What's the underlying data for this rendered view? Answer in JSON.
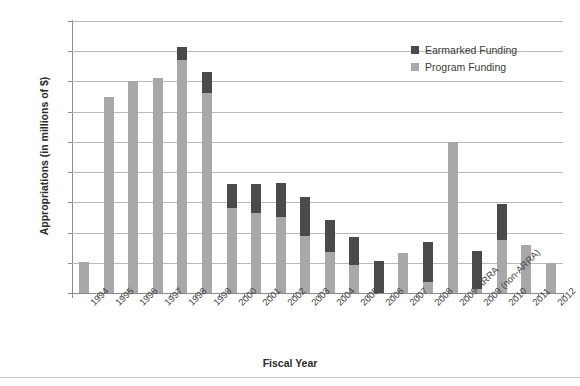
{
  "chart_data": {
    "type": "bar",
    "title": "",
    "xlabel": "Fiscal Year",
    "ylabel": "Appropriations (in millions of $)",
    "ylim": [
      0,
      1800
    ],
    "ytick_step": 200,
    "yticks": [
      0,
      200,
      400,
      600,
      800,
      1000,
      1200,
      1400,
      1600,
      1800
    ],
    "grid": true,
    "stacked": true,
    "legend_position": "upper right",
    "categories": [
      "1994",
      "1995",
      "1996",
      "1997",
      "1998",
      "1999",
      "2000",
      "2001",
      "2002",
      "2003",
      "2004",
      "2005",
      "2006",
      "2007",
      "2008",
      "2009-ARRA",
      "2009 (non-ARRA)",
      "2010",
      "2011",
      "2012"
    ],
    "series": [
      {
        "name": "Program Funding",
        "color": "#a8a8a8",
        "values": [
          205,
          1300,
          1400,
          1420,
          1540,
          1325,
          560,
          530,
          500,
          375,
          270,
          185,
          0,
          265,
          75,
          1000,
          25,
          350,
          315,
          200
        ]
      },
      {
        "name": "Earmarked Funding",
        "color": "#4a4a4a",
        "values": [
          0,
          0,
          0,
          0,
          90,
          135,
          160,
          190,
          230,
          260,
          210,
          185,
          215,
          0,
          265,
          0,
          255,
          240,
          0,
          0
        ]
      }
    ],
    "totals": [
      205,
      1300,
      1400,
      1420,
      1630,
      1460,
      720,
      720,
      730,
      635,
      480,
      370,
      215,
      265,
      340,
      1000,
      280,
      590,
      315,
      200
    ]
  },
  "legend": {
    "entries": [
      {
        "label": "Earmarked Funding",
        "color": "#4a4a4a"
      },
      {
        "label": "Program Funding",
        "color": "#a8a8a8"
      }
    ]
  },
  "colors": {
    "program_funding": "#a8a8a8",
    "earmarked_funding": "#4a4a4a",
    "gridline": "#b9b9b9",
    "axis": "#8c8c8c",
    "text": "#3a3a3a"
  }
}
